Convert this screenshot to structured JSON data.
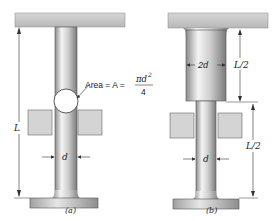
{
  "figure_a": {
    "caption": "(a)",
    "length_label": "L",
    "diameter_label": "d",
    "area_prefix": "Area = A = ",
    "area_numerator": "πd",
    "area_exponent": "2",
    "area_denominator": "4"
  },
  "figure_b": {
    "caption": "(b)",
    "upper_diameter_label": "2d",
    "upper_length_label": "L/2",
    "lower_diameter_label": "d",
    "lower_length_label": "L/2"
  },
  "colors": {
    "plate": "#c8c8c8",
    "rod_light": "#f0f0f0",
    "rod_dark": "#9a9a9a",
    "block": "#d4d4d4",
    "line": "#333333"
  }
}
